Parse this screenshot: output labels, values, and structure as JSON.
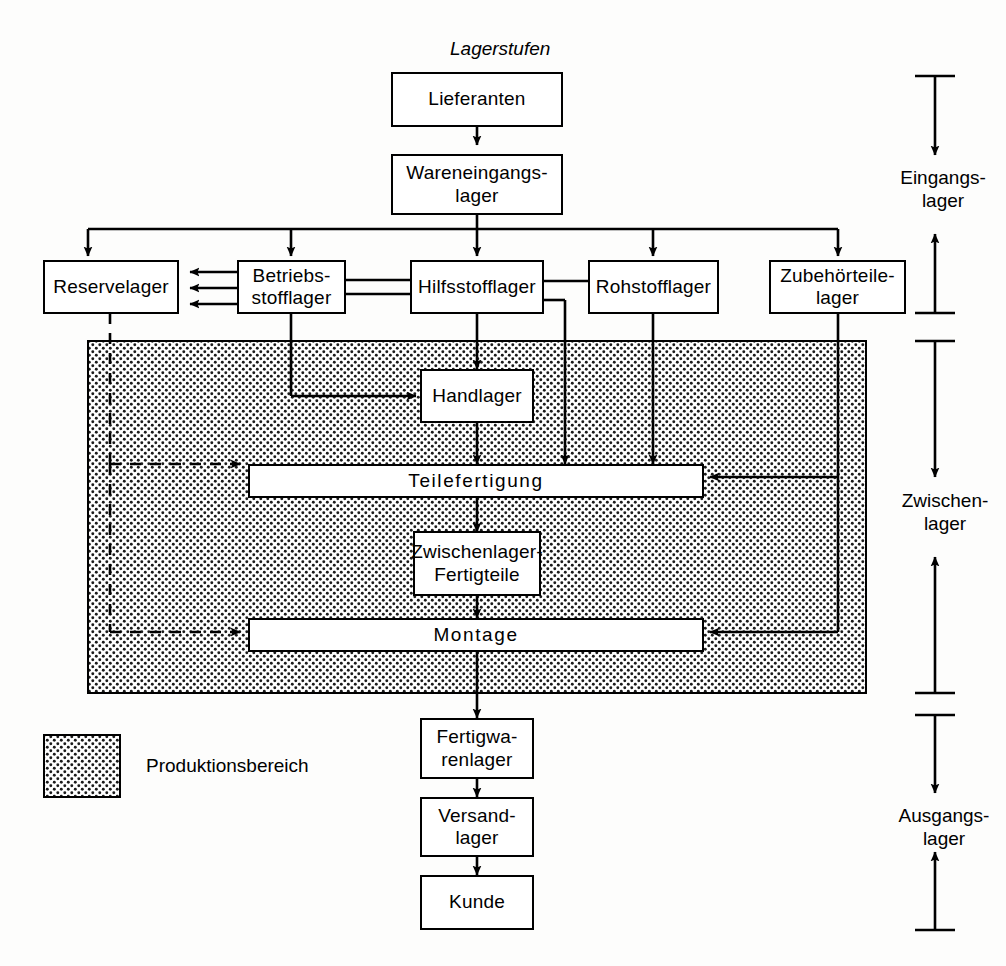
{
  "diagram": {
    "caption": "Lagerstufen",
    "legend": {
      "label": "Produktionsbereich",
      "fill_color": "#ffffff",
      "dot_color": "#1a1a1a"
    },
    "nodes": {
      "lieferanten": "Lieferanten",
      "wareneingangslager": "Wareneingangs-\nlager",
      "reservelager": "Reservelager",
      "betriebsstofflager": "Betriebs-\nstofflager",
      "hilfsstofflager": "Hilfsstofflager",
      "rohstofflager": "Rohstofflager",
      "zubehoerteilelager": "Zubehörteile-\nlager",
      "handlager": "Handlager",
      "teilefertigung": "Teilefertigung",
      "zwischenlager_fertigteile": "Zwischenlager-\nFertigteile",
      "montage": "Montage",
      "fertigwarenlager": "Fertigwa-\nrenlager",
      "versandlager": "Versand-\nlager",
      "kunde": "Kunde"
    },
    "stage_labels": {
      "eingangslager": "Eingangs-\nlager",
      "zwischenlager": "Zwischen-\nlager",
      "ausgangslager": "Ausgangs-\nlager"
    }
  }
}
